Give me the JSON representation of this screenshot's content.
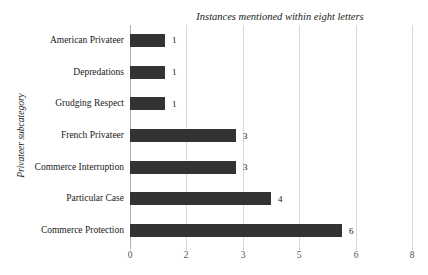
{
  "chart_data": {
    "type": "bar",
    "orientation": "horizontal",
    "title": "Instances mentioned within eight letters",
    "xlabel": "",
    "ylabel": "Privateer subcategory",
    "categories": [
      "American Privateer",
      "Depredations",
      "Grudging Respect",
      "French Privateer",
      "Commerce Interruption",
      "Particular Case",
      "Commerce Protection"
    ],
    "values": [
      1,
      1,
      1,
      3,
      3,
      4,
      6
    ],
    "data_labels": [
      "1",
      "1",
      "1",
      "3",
      "3",
      "4",
      "6"
    ],
    "xlim": [
      0,
      8
    ],
    "xticks": [
      0,
      2,
      3,
      5,
      6,
      8
    ],
    "xtick_labels": [
      "0",
      "2",
      "3",
      "5",
      "6",
      "8"
    ],
    "grid": "vertical",
    "legend": "none",
    "bar_color": "#333333",
    "gridline_color": "#d9d9d9",
    "axis_color": "#b0b0b0",
    "background_color": "#ffffff"
  }
}
